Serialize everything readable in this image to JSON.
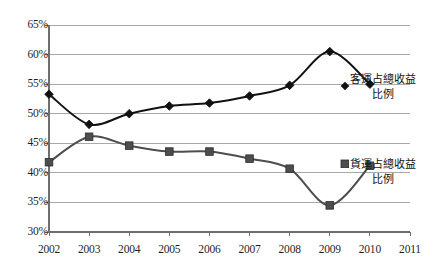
{
  "chart_data": {
    "type": "line",
    "title": "",
    "subtitle": "",
    "xlabel": "",
    "ylabel": "",
    "x": [
      2002,
      2003,
      2004,
      2005,
      2006,
      2007,
      2008,
      2009,
      2010,
      2011
    ],
    "categories": [
      "2002",
      "2003",
      "2004",
      "2005",
      "2006",
      "2007",
      "2008",
      "2009",
      "2010",
      "2011"
    ],
    "xlim": [
      2002,
      2011
    ],
    "ylim": [
      30,
      65
    ],
    "ytick_values": [
      65,
      60,
      55,
      50,
      45,
      40,
      35,
      30
    ],
    "ytick_labels": [
      "65%",
      "60%",
      "55%",
      "50%",
      "45%",
      "40%",
      "35%",
      "30%"
    ],
    "grid": true,
    "grid_axis": "y",
    "legend_position": "inline-right",
    "series": [
      {
        "name": "客運占總收益比例",
        "name_line1": "客運占總收益",
        "name_line2": "比例",
        "marker": "diamond",
        "color": "#111111",
        "x": [
          2002,
          2003,
          2004,
          2005,
          2006,
          2007,
          2008,
          2009,
          2010
        ],
        "values": [
          53.3,
          48.2,
          50.0,
          51.3,
          51.8,
          53.0,
          54.8,
          60.5,
          55.0
        ]
      },
      {
        "name": "貨運占總收益比例",
        "name_line1": "貨運占總收益",
        "name_line2": "比例",
        "marker": "square",
        "color": "#4d4d4d",
        "x": [
          2002,
          2003,
          2004,
          2005,
          2006,
          2007,
          2008,
          2009,
          2010
        ],
        "values": [
          41.8,
          46.1,
          44.6,
          43.6,
          43.6,
          42.4,
          40.7,
          34.5,
          41.2
        ]
      }
    ]
  },
  "style": {
    "grid_color": "#a8a8a8",
    "axis_color": "#6e6e6e",
    "background": "#ffffff",
    "passenger_color": "#111111",
    "freight_color": "#4d4d4d"
  }
}
